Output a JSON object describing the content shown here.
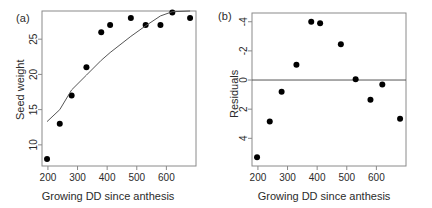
{
  "figure": {
    "width": 432,
    "height": 208,
    "background": "#ffffff",
    "point_color": "#000000",
    "line_color": "#555555",
    "axis_color": "#8a8a8a",
    "text_color": "#2b2b2b"
  },
  "panels": [
    {
      "id": "a",
      "label": "(a)",
      "xlabel": "Growing DD since anthesis",
      "ylabel": "Seed weight"
    },
    {
      "id": "b",
      "label": "(b)",
      "xlabel": "Growing DD since anthesis",
      "ylabel": "Residuals"
    }
  ],
  "chart_data": [
    {
      "type": "scatter",
      "panel": "(a)",
      "title": "",
      "xlabel": "Growing DD since anthesis",
      "ylabel": "Seed weight",
      "xlim": [
        180,
        700
      ],
      "ylim": [
        7,
        29
      ],
      "xticks": [
        200,
        300,
        400,
        500,
        600
      ],
      "yticks": [
        10,
        15,
        20,
        25
      ],
      "grid": false,
      "legend": "none",
      "series": [
        {
          "name": "Seed weight observations",
          "marker": "filled-circle",
          "x": [
            197,
            240,
            280,
            330,
            380,
            410,
            480,
            530,
            580,
            620,
            680
          ],
          "y": [
            8,
            13,
            17,
            21,
            26,
            27,
            28,
            27,
            27,
            28.8,
            28
          ]
        },
        {
          "name": "Fitted saturating curve",
          "marker": "line",
          "x": [
            197,
            240,
            280,
            330,
            380,
            410,
            480,
            530,
            580,
            620,
            680
          ],
          "y": [
            13.3,
            15.0,
            17.8,
            19.9,
            22.0,
            23.1,
            25.4,
            26.9,
            28.3,
            28.9,
            29.0
          ]
        }
      ]
    },
    {
      "type": "scatter",
      "panel": "(b)",
      "title": "",
      "xlabel": "Growing DD since anthesis",
      "ylabel": "Residuals",
      "xlim": [
        180,
        700
      ],
      "ylim": [
        -5.9,
        4.6
      ],
      "xticks": [
        200,
        300,
        400,
        500,
        600
      ],
      "yticks": [
        -4,
        -2,
        0,
        2,
        4
      ],
      "grid": false,
      "legend": "none",
      "reference_line": {
        "y": 0,
        "orientation": "horizontal"
      },
      "series": [
        {
          "name": "Residuals",
          "marker": "filled-circle",
          "x": [
            197,
            240,
            280,
            330,
            380,
            410,
            480,
            530,
            580,
            620,
            680
          ],
          "y": [
            -5.3,
            -2.85,
            -0.8,
            1.05,
            4.0,
            3.9,
            2.45,
            0.05,
            -1.35,
            -0.3,
            -2.65
          ]
        }
      ]
    }
  ],
  "xticklabels": [
    "200",
    "300",
    "400",
    "500",
    "600"
  ],
  "yticklabels_a": [
    "10",
    "15",
    "20",
    "25"
  ],
  "yticklabels_b": [
    "4",
    "2",
    "0",
    "-2",
    "-4"
  ]
}
